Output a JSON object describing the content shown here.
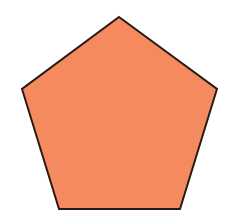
{
  "diagram": {
    "shape": "pentagon",
    "fill_color": "#F58A5E",
    "stroke_color": "#2A1A14",
    "stroke_width": 2,
    "points": "119,17 217,89 180,209 59,209 22,89",
    "background_color": "#FFFFFF"
  }
}
